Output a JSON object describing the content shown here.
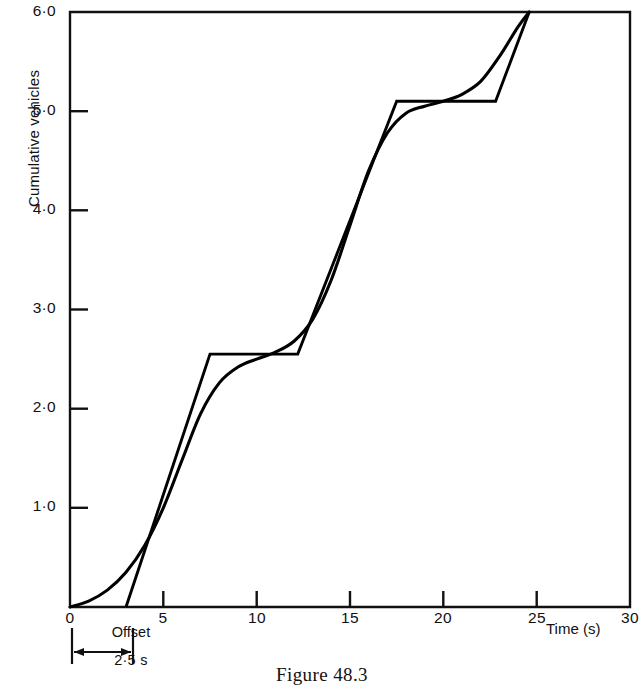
{
  "caption": "Figure 48.3",
  "axes": {
    "y_title": "Cumulative vehicles",
    "x_title": "Time (s)",
    "y_tick_labels": [
      "6·0",
      "5·0",
      "4·0",
      "3·0",
      "2·0",
      "1·0"
    ],
    "y_origin_label": "0",
    "x_tick_labels": [
      "0",
      "5",
      "10",
      "15",
      "20",
      "25",
      "30"
    ]
  },
  "annotation": {
    "offset_label": "Offset",
    "offset_value": "2·5 s"
  },
  "chart_data": {
    "type": "line",
    "title": "Figure 48.3",
    "xlabel": "Time (s)",
    "ylabel": "Cumulative vehicles",
    "xlim": [
      0,
      30
    ],
    "ylim": [
      0,
      6
    ],
    "xticks": [
      0,
      5,
      10,
      15,
      20,
      25,
      30
    ],
    "yticks": [
      0,
      1,
      2,
      3,
      4,
      5,
      6
    ],
    "ytick_text": [
      "0",
      "1·0",
      "2·0",
      "3·0",
      "4·0",
      "5·0",
      "6·0"
    ],
    "grid": false,
    "legend": null,
    "frame": "full-box",
    "annotations": [
      {
        "text": "Offset",
        "value_text": "2·5 s",
        "value": 2.5,
        "units": "s",
        "x_from": 0,
        "x_to": 2.5,
        "placement": "below-x-axis"
      }
    ],
    "series": [
      {
        "name": "smooth-cumulative-curve",
        "style": "smooth",
        "color": "#000000",
        "points": [
          [
            0.0,
            0.0
          ],
          [
            1.0,
            0.06
          ],
          [
            2.0,
            0.17
          ],
          [
            3.0,
            0.35
          ],
          [
            4.0,
            0.62
          ],
          [
            5.0,
            1.0
          ],
          [
            6.0,
            1.48
          ],
          [
            7.0,
            1.95
          ],
          [
            8.0,
            2.26
          ],
          [
            9.0,
            2.42
          ],
          [
            10.0,
            2.5
          ],
          [
            11.0,
            2.57
          ],
          [
            12.0,
            2.68
          ],
          [
            13.0,
            2.9
          ],
          [
            14.0,
            3.3
          ],
          [
            15.0,
            3.85
          ],
          [
            16.0,
            4.4
          ],
          [
            17.0,
            4.78
          ],
          [
            18.0,
            4.98
          ],
          [
            19.0,
            5.05
          ],
          [
            20.0,
            5.1
          ],
          [
            21.0,
            5.17
          ],
          [
            22.0,
            5.3
          ],
          [
            23.0,
            5.55
          ],
          [
            24.0,
            5.85
          ],
          [
            24.6,
            6.0
          ]
        ]
      },
      {
        "name": "piecewise-offset-curve",
        "style": "straight-segments",
        "color": "#000000",
        "points": [
          [
            3.0,
            0.0
          ],
          [
            7.5,
            2.55
          ],
          [
            12.2,
            2.55
          ],
          [
            17.5,
            5.1
          ],
          [
            22.8,
            5.1
          ],
          [
            24.6,
            6.0
          ]
        ]
      }
    ]
  }
}
